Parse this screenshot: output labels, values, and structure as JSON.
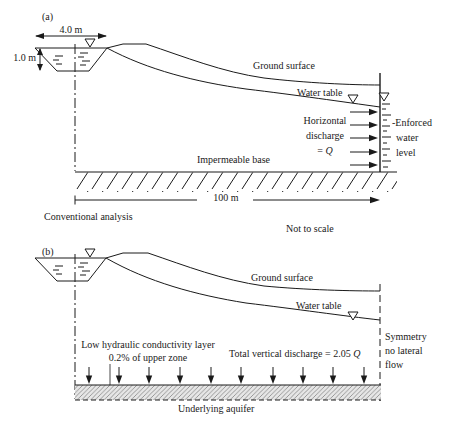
{
  "panel_a": {
    "label": "(a)",
    "width_dim": "4.0 m",
    "depth_dim": "1.0 m",
    "ground_surface_label": "Ground surface",
    "water_table_label": "Water table",
    "discharge": {
      "line1": "Horizontal",
      "line2": "discharge",
      "eq": "= ",
      "q": "Q"
    },
    "enforced": {
      "line1": "-Enforced",
      "line2": "water",
      "line3": "level"
    },
    "impermeable_base_label": "Impermeable base",
    "length_dim": "100 m",
    "caption": "Conventional analysis",
    "scale_note": "Not to scale"
  },
  "panel_b": {
    "label": "(b)",
    "ground_surface_label": "Ground surface",
    "water_table_label": "Water table",
    "low_k_layer": {
      "line1": "Low hydraulic conductivity layer",
      "line2": "0.2% of upper zone"
    },
    "total_discharge": {
      "text": "Total vertical discharge = 2.05 ",
      "q": "Q"
    },
    "symmetry": {
      "line1": "Symmetry",
      "line2": "no lateral",
      "line3": "flow"
    },
    "aquifer_label": "Underlying aquifer"
  },
  "colors": {
    "ink": "#1a1a1a",
    "layer_fill": "#e6e6e6",
    "background": "#ffffff"
  }
}
